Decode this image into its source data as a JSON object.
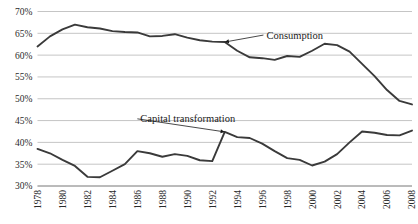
{
  "chart_data": {
    "type": "line",
    "title": "",
    "subtitle": "",
    "xlabel": "",
    "ylabel": "",
    "xlim": [
      1978,
      2008
    ],
    "ylim": [
      30,
      70
    ],
    "grid": true,
    "grid_axis": "y",
    "legend": "none",
    "x": [
      1978,
      1979,
      1980,
      1981,
      1982,
      1983,
      1984,
      1985,
      1986,
      1987,
      1988,
      1989,
      1990,
      1991,
      1992,
      1993,
      1994,
      1995,
      1996,
      1997,
      1998,
      1999,
      2000,
      2001,
      2002,
      2003,
      2004,
      2005,
      2006,
      2007,
      2008
    ],
    "ytick_labels": [
      "30%",
      "35%",
      "40%",
      "45%",
      "50%",
      "55%",
      "60%",
      "65%",
      "70%"
    ],
    "ytick_values": [
      30,
      35,
      40,
      45,
      50,
      55,
      60,
      65,
      70
    ],
    "xtick_labels": [
      "1978",
      "1980",
      "1982",
      "1984",
      "1986",
      "1988",
      "1990",
      "1992",
      "1994",
      "1996",
      "1998",
      "2000",
      "2002",
      "2004",
      "2006",
      "2008"
    ],
    "xtick_values": [
      1978,
      1980,
      1982,
      1984,
      1986,
      1988,
      1990,
      1992,
      1994,
      1996,
      1998,
      2000,
      2002,
      2004,
      2006,
      2008
    ],
    "series": [
      {
        "name": "Consumption",
        "color": "#3a3a3a",
        "values": [
          62.0,
          64.3,
          65.9,
          67.0,
          66.4,
          66.1,
          65.5,
          65.3,
          65.2,
          64.3,
          64.4,
          64.8,
          64.0,
          63.4,
          63.1,
          63.0,
          61.0,
          59.5,
          59.3,
          58.9,
          59.8,
          59.6,
          61.0,
          62.6,
          62.3,
          60.8,
          58.0,
          55.2,
          52.0,
          49.5,
          48.7
        ]
      },
      {
        "name": "Capital transformation",
        "color": "#3a3a3a",
        "values": [
          38.5,
          37.5,
          36.0,
          34.6,
          32.1,
          32.0,
          33.5,
          35.0,
          38.0,
          37.5,
          36.7,
          37.3,
          36.9,
          35.9,
          35.7,
          42.4,
          41.2,
          41.0,
          39.7,
          38.0,
          36.4,
          36.0,
          34.7,
          35.6,
          37.3,
          40.0,
          42.5,
          42.2,
          41.7,
          41.6,
          42.7
        ]
      }
    ],
    "annotations": [
      {
        "id": "consumption-annotation",
        "text": "Consumption",
        "target_x": 1993,
        "target_y": 63.0,
        "label_x": 1996.1,
        "label_y": 64.6
      },
      {
        "id": "capital-transformation-annotation",
        "text": "Capital transformation",
        "target_x": 1993,
        "target_y": 42.4,
        "label_x": 1986.0,
        "label_y": 45.4
      }
    ]
  }
}
